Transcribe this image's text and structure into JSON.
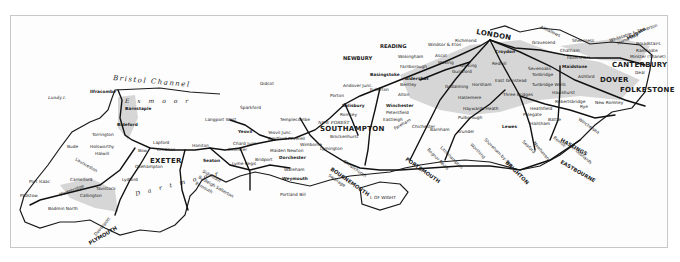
{
  "map": {
    "title": "Southern England railway map",
    "colors": {
      "rail": "#111111",
      "coast": "#1a1a1a",
      "shade": "#d9d9d9",
      "frame": "#c8c8c8",
      "paper": "#fdfdfd"
    },
    "sea_labels": {
      "bristol_channel": "Bristol Channel"
    },
    "area_labels": {
      "exmoor": "E x m o o r",
      "dartmoor": "D a r t m o o r",
      "new_forest": "NEW FOREST"
    },
    "island_labels": {
      "lundy": "Lundy I.",
      "wight": "I. OF WIGHT"
    },
    "major_towns": {
      "london": "LONDON",
      "exeter": "EXETER",
      "plymouth": "PLYMOUTH",
      "southampton": "SOUTHAMPTON",
      "bournemouth": "BOURNEMOUTH",
      "portsmouth": "PORTSMOUTH",
      "brighton": "BRIGHTON",
      "eastbourne": "EASTBOURNE",
      "hastings": "HASTINGS",
      "folkestone": "FOLKESTONE",
      "dover": "DOVER",
      "canterbury": "CANTERBURY"
    },
    "towns": {
      "ilfracombe": "Ilfracombe",
      "barnstaple": "Barnstaple",
      "bideford": "Bideford",
      "torrington": "Torrington",
      "bude": "Bude",
      "holsworthy": "Holsworthy",
      "halwill": "Halwill",
      "launceston": "Launceston",
      "port_isaac": "Port Isaac",
      "camelford": "Camelford",
      "padstow": "Padstow",
      "wadebridge": "Wadebridge",
      "bodmin_north": "Bodmin North",
      "tavistock": "Tavistock",
      "callington": "Callington",
      "lydford": "Lydford",
      "devonport": "Devonport",
      "okehampton": "Okehampton",
      "bow": "Bow",
      "lapford": "Lapford",
      "crediton": "Crediton",
      "honiton": "Honiton",
      "seaton": "Seaton",
      "sidmouth": "Sidmouth",
      "budleigh_salterton": "Budleigh Salterton",
      "exmouth": "Exmouth",
      "lyme_regis": "Lyme Regis",
      "chard_junc": "Chard Junc.",
      "ilminster": "Ilminster",
      "yeovil": "Yeovil",
      "sparkford": "Sparkford",
      "langport_west": "Langport West",
      "templecombe": "Templecombe",
      "sherborne": "Sherborne",
      "yeovil_junc": "Yeovil Junc.",
      "bradford_peverell": "Bradford Peverell",
      "maiden_newton": "Maiden Newton",
      "bridport": "Bridport",
      "dorchester": "Dorchester",
      "wimborne": "Wimborne",
      "weymouth": "Weymouth",
      "portland_bill": "Portland Bill",
      "wareham": "Wareham",
      "swanage": "Swanage",
      "poole": "Poole",
      "christchurch": "Christchurch",
      "brockenhurst": "Brockenhurst",
      "lymington": "Lymington",
      "yarmouth": "Yarmouth",
      "romsey": "Romsey",
      "salisbury": "Salisbury",
      "porton": "Porton",
      "andover_junc": "Andover Junc.",
      "fullerton": "Fullerton",
      "didcot": "Didcot",
      "newbury": "NEWBURY",
      "reading": "READING",
      "basingstoke": "Basingstoke",
      "winchester": "Winchester",
      "eastleigh": "Eastleigh",
      "petersfield": "Petersfield",
      "alton": "Alton",
      "bentley": "Bentley",
      "aldershot": "Aldershot",
      "farnborough": "Farnborough",
      "wokingham": "Wokingham",
      "windsor": "Windsor & Eton",
      "ascot": "Ascot",
      "woking": "Woking",
      "richmond": "Richmond",
      "guildford": "Guildford",
      "dorking": "Dorking",
      "godalming": "Godalming",
      "haslemere": "Haslemere",
      "horsham": "Horsham",
      "croydon": "Croydon",
      "redhill": "Redhill",
      "east_grinstead": "East Grinstead",
      "three_bridges": "Three Bridges",
      "haywards_heath": "Haywards Heath",
      "pulborough": "Pulborough",
      "arundel": "Arundel",
      "barnham": "Barnham",
      "chichester": "Chichester",
      "fareham": "Fareham",
      "havant": "Havant",
      "hayling": "Hayling Is.",
      "bognor": "Bognor Regis",
      "littlehampton": "Littlehampton",
      "worthing": "Worthing",
      "shoreham": "Shoreham-by-Sea",
      "lewes": "Lewes",
      "newhaven": "Newhaven",
      "seaford": "Seaford",
      "polegate": "Polegate",
      "hailsham": "Hailsham",
      "heathfield": "Heathfield",
      "battle": "Battle",
      "bexhill": "Bexhill",
      "st_leonards": "St. Leonards",
      "winchelsea": "Winchelsea",
      "rye": "Rye",
      "new_romney": "New Romney",
      "robertsbridge": "Robertsbridge",
      "hawkhurst": "Hawkhurst",
      "tunbridge_wells": "Tunbridge Wells",
      "tonbridge": "Tonbridge",
      "sevenoaks": "Sevenoaks",
      "maidstone": "Maidstone",
      "ashford": "Ashford",
      "faversham": "Faversham",
      "chatham": "Chatham",
      "gravesend": "Gravesend",
      "sheerness": "Sheerness",
      "whitstable": "Whitstable & Tankerton",
      "herne_bay": "Herne Bay",
      "margate": "Margate",
      "broadstairs": "Broadstairs",
      "ramsgate": "Ramsgate",
      "minster": "Minster (Thanet)",
      "deal": "Deal",
      "allhallows": "Allhallows",
      "hythe": "Hythe"
    }
  }
}
